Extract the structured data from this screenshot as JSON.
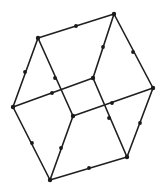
{
  "diagram": {
    "type": "graph",
    "colors": {
      "stroke": "#1f1f1f",
      "fill": "#1a1a1a",
      "background": "#ffffff"
    },
    "vertices": [
      {
        "id": "TL",
        "x": 38,
        "y": 38
      },
      {
        "id": "TR",
        "x": 114,
        "y": 14
      },
      {
        "id": "R",
        "x": 153,
        "y": 88
      },
      {
        "id": "IU",
        "x": 93,
        "y": 78
      },
      {
        "id": "L",
        "x": 13,
        "y": 107
      },
      {
        "id": "IL",
        "x": 73,
        "y": 116
      },
      {
        "id": "BR",
        "x": 127,
        "y": 157
      },
      {
        "id": "B",
        "x": 50,
        "y": 180
      }
    ],
    "edges": [
      {
        "from": "TL",
        "to": "TR",
        "mark": {
          "x": 76,
          "y": 26
        }
      },
      {
        "from": "TR",
        "to": "R",
        "mark": {
          "x": 133,
          "y": 52
        }
      },
      {
        "from": "TR",
        "to": "IU",
        "mark": {
          "x": 103,
          "y": 47
        }
      },
      {
        "from": "TL",
        "to": "L",
        "mark": {
          "x": 25,
          "y": 72
        }
      },
      {
        "from": "TL",
        "to": "IL",
        "mark": {
          "x": 55,
          "y": 78
        }
      },
      {
        "from": "L",
        "to": "IU",
        "mark": {
          "x": 52,
          "y": 93
        }
      },
      {
        "from": "IU",
        "to": "BR",
        "mark": {
          "x": 109,
          "y": 118
        }
      },
      {
        "from": "IL",
        "to": "R",
        "mark": {
          "x": 112,
          "y": 103
        }
      },
      {
        "from": "R",
        "to": "BR",
        "mark": {
          "x": 140,
          "y": 123
        }
      },
      {
        "from": "L",
        "to": "B",
        "mark": {
          "x": 32,
          "y": 143
        }
      },
      {
        "from": "IL",
        "to": "B",
        "mark": {
          "x": 61,
          "y": 148
        }
      },
      {
        "from": "B",
        "to": "BR",
        "mark": {
          "x": 89,
          "y": 168
        }
      }
    ]
  }
}
